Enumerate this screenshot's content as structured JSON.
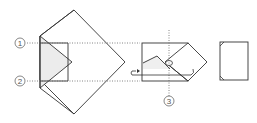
{
  "steps": [
    {
      "label": "1"
    },
    {
      "label": "2"
    },
    {
      "label": "3"
    }
  ],
  "colors": {
    "line": "#333333",
    "dotted": "#666666",
    "shade": "#e8e8e8"
  }
}
